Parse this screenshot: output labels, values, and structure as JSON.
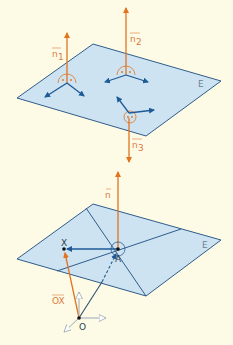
{
  "colors": {
    "background": "#fdfbe6",
    "plane_fill": "#cde3f2",
    "plane_edge": "#2f5d8a",
    "normal": "#e2731f",
    "in_plane_vector": "#1e5a96",
    "right_angle_mark": "#e2731f",
    "point": "#111111",
    "axis_outline": "#9aa8b4"
  },
  "figure_top": {
    "plane_label": "E",
    "normals": [
      {
        "label": "n",
        "subscript": "1",
        "direction": "up"
      },
      {
        "label": "n",
        "subscript": "2",
        "direction": "up"
      },
      {
        "label": "n",
        "subscript": "3",
        "direction": "down"
      }
    ]
  },
  "figure_bottom": {
    "plane_label": "E",
    "normal_label": "n",
    "points": {
      "X": "X",
      "A": "A",
      "O": "O"
    },
    "vector_label": "OX"
  }
}
